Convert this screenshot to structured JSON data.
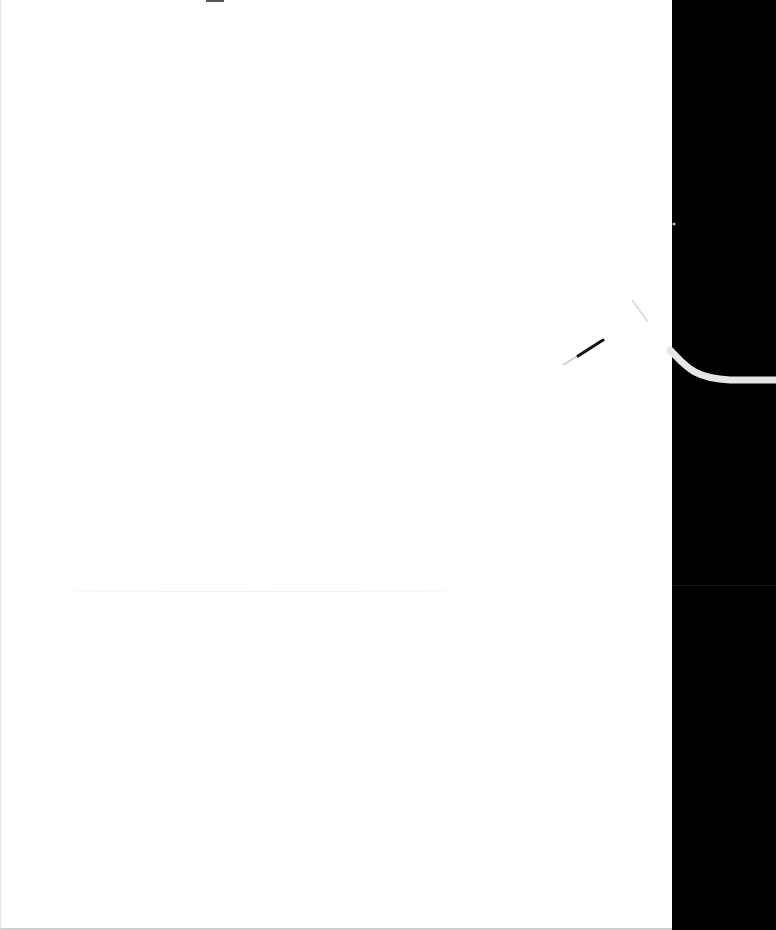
{
  "scene": {
    "description": "Photograph of a blank white sheet of paper on a black surface with a white cable entering from the right",
    "background_color": "#000000",
    "paper_color": "#ffffff",
    "cable_color": "#e6e6e6",
    "paper_text": ""
  }
}
